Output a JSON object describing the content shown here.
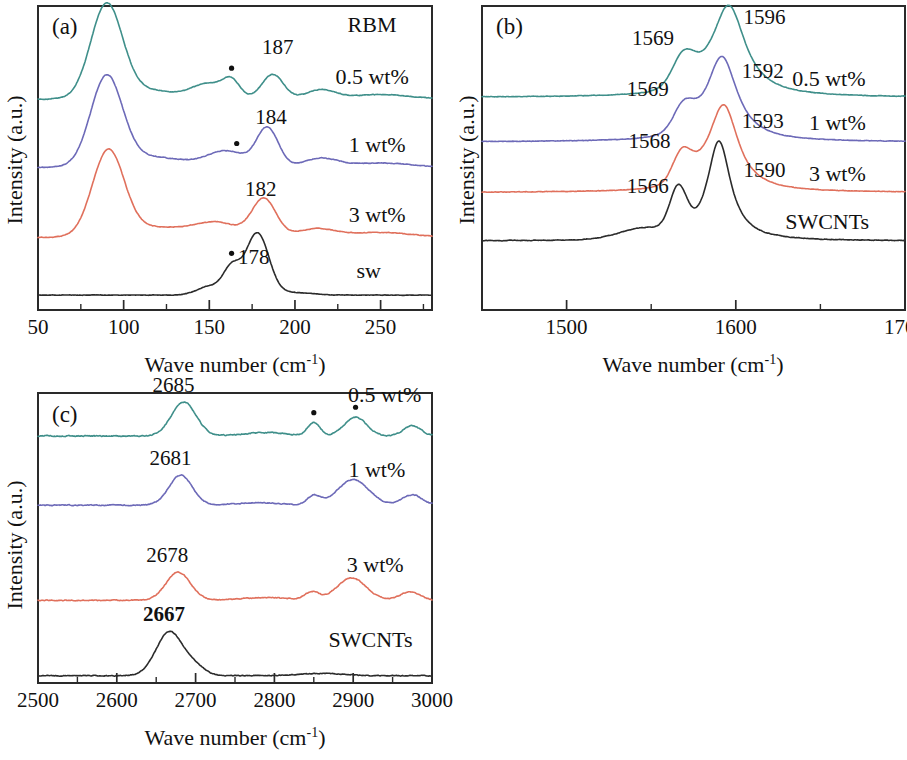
{
  "figure": {
    "background": "#ffffff",
    "width": 907,
    "height": 760
  },
  "colors": {
    "teal": "#3f8f8a",
    "purple": "#6d6ab8",
    "salmon": "#e0705c",
    "black": "#2b2b2b",
    "axis": "#2a2a2a"
  },
  "axis_titles": {
    "x": "Wave number (cm",
    "x_sup": "-1",
    "x_close": ")",
    "y": "Intensity (a.u.)"
  },
  "panels": [
    {
      "id": "a",
      "tag": "(a)",
      "corner_label": "RBM",
      "xlabel": "Wave number (cm-1)",
      "ylabel": "Intensity (a.u.)",
      "xlim": [
        50,
        280
      ],
      "major_ticks": [
        50,
        100,
        150,
        200,
        250
      ],
      "minor_ticks": [
        75,
        125,
        175,
        225,
        275
      ],
      "tick_labels": [
        "50",
        "100",
        "150",
        "200",
        "250"
      ],
      "series": [
        {
          "name": "0.5 wt%",
          "color": "#3f8f8a",
          "label": "0.5 wt%",
          "label_x": 245,
          "peak_label": "187",
          "peak_label_x": 190,
          "dots": [
            163
          ]
        },
        {
          "name": "1 wt%",
          "color": "#6d6ab8",
          "label": "1 wt%",
          "label_x": 248,
          "peak_label": "184",
          "peak_label_x": 186,
          "dots": [
            166
          ]
        },
        {
          "name": "3 wt%",
          "color": "#e0705c",
          "label": "3 wt%",
          "label_x": 248,
          "peak_label": "182",
          "peak_label_x": 180,
          "dots": []
        },
        {
          "name": "sw",
          "color": "#2b2b2b",
          "label": "sw",
          "label_x": 243,
          "peak_label": "178",
          "peak_label_x": 176,
          "dots": [
            163
          ]
        }
      ]
    },
    {
      "id": "b",
      "tag": "(b)",
      "corner_label": "",
      "xlabel": "Wave number (cm-1)",
      "ylabel": "Intensity (a.u.)",
      "xlim": [
        1450,
        1700
      ],
      "major_ticks": [
        1500,
        1600,
        1700
      ],
      "minor_ticks": [
        1450,
        1550,
        1650
      ],
      "tick_labels": [
        "1500",
        "1600",
        "1700"
      ],
      "series": [
        {
          "name": "0.5 wt%",
          "color": "#3f8f8a",
          "label": "0.5 wt%",
          "label_x": 1655,
          "peak_labels": [
            {
              "text": "1596",
              "x": 1617
            },
            {
              "text": "1569",
              "x": 1551
            }
          ],
          "dots": []
        },
        {
          "name": "1 wt%",
          "color": "#6d6ab8",
          "label": "1 wt%",
          "label_x": 1660,
          "peak_labels": [
            {
              "text": "1592",
              "x": 1616
            },
            {
              "text": "1569",
              "x": 1548
            }
          ],
          "dots": []
        },
        {
          "name": "3 wt%",
          "color": "#e0705c",
          "label": "3 wt%",
          "label_x": 1660,
          "peak_labels": [
            {
              "text": "1593",
              "x": 1616
            },
            {
              "text": "1568",
              "x": 1549
            }
          ],
          "dots": []
        },
        {
          "name": "SWCNTs",
          "color": "#2b2b2b",
          "label": "SWCNTs",
          "label_x": 1654,
          "peak_labels": [
            {
              "text": "1590",
              "x": 1617
            },
            {
              "text": "1566",
              "x": 1548
            }
          ],
          "dots": []
        }
      ]
    },
    {
      "id": "c",
      "tag": "(c)",
      "corner_label": "",
      "xlabel": "Wave number (cm-1)",
      "ylabel": "Intensity (a.u.)",
      "xlim": [
        2500,
        3000
      ],
      "major_ticks": [
        2500,
        2600,
        2700,
        2800,
        2900,
        3000
      ],
      "minor_ticks": [
        2550,
        2650,
        2750,
        2850,
        2950
      ],
      "tick_labels": [
        "2500",
        "2600",
        "2700",
        "2800",
        "2900",
        "3000"
      ],
      "series": [
        {
          "name": "0.5 wt%",
          "color": "#3f8f8a",
          "label": "0.5 wt%",
          "label_x": 2940,
          "peak_label": "2685",
          "peak_label_x": 2672,
          "bold": false,
          "dots": [
            2850,
            2903
          ]
        },
        {
          "name": "1 wt%",
          "color": "#6d6ab8",
          "label": "1 wt%",
          "label_x": 2930,
          "peak_label": "2681",
          "peak_label_x": 2668,
          "bold": false,
          "dots": []
        },
        {
          "name": "3 wt%",
          "color": "#e0705c",
          "label": "3 wt%",
          "label_x": 2928,
          "peak_label": "2678",
          "peak_label_x": 2664,
          "bold": false,
          "dots": []
        },
        {
          "name": "SWCNTs",
          "color": "#2b2b2b",
          "label": "SWCNTs",
          "label_x": 2922,
          "peak_label": "2667",
          "peak_label_x": 2660,
          "bold": true,
          "dots": []
        }
      ]
    }
  ],
  "chart_data": {
    "type": "line",
    "xlabel": "Wave number (cm-1)",
    "ylabel": "Intensity (a.u.)",
    "note": "Three-panel stacked-offset Raman spectra. Panel (a) RBM region, panel (b) G-band region, panel (c) G'/2D region. Dots mark impurity/reference bands.",
    "panels": [
      {
        "panel": "a",
        "region": "RBM",
        "xlim": [
          50,
          280
        ],
        "xticks": [
          50,
          100,
          150,
          200,
          250
        ],
        "series": [
          {
            "name": "0.5 wt%",
            "color": "#3f8f8a",
            "peaks_cm1": [
              90,
              187
            ],
            "marked_dot_cm1": [
              163
            ]
          },
          {
            "name": "1 wt%",
            "color": "#6d6ab8",
            "peaks_cm1": [
              90,
              184
            ],
            "marked_dot_cm1": [
              166
            ]
          },
          {
            "name": "3 wt%",
            "color": "#e0705c",
            "peaks_cm1": [
              91,
              182
            ],
            "marked_dot_cm1": []
          },
          {
            "name": "sw",
            "color": "#2b2b2b",
            "peaks_cm1": [
              178
            ],
            "marked_dot_cm1": [
              163
            ]
          }
        ]
      },
      {
        "panel": "b",
        "region": "G band",
        "xlim": [
          1450,
          1700
        ],
        "xticks": [
          1500,
          1600,
          1700
        ],
        "series": [
          {
            "name": "0.5 wt%",
            "color": "#3f8f8a",
            "peaks_cm1": [
              1569,
              1596
            ]
          },
          {
            "name": "1 wt%",
            "color": "#6d6ab8",
            "peaks_cm1": [
              1569,
              1592
            ]
          },
          {
            "name": "3 wt%",
            "color": "#e0705c",
            "peaks_cm1": [
              1568,
              1593
            ]
          },
          {
            "name": "SWCNTs",
            "color": "#2b2b2b",
            "peaks_cm1": [
              1566,
              1590
            ]
          }
        ]
      },
      {
        "panel": "c",
        "region": "G' / 2D band",
        "xlim": [
          2500,
          3000
        ],
        "xticks": [
          2500,
          2600,
          2700,
          2800,
          2900,
          3000
        ],
        "series": [
          {
            "name": "0.5 wt%",
            "color": "#3f8f8a",
            "peaks_cm1": [
              2685
            ],
            "marked_dot_cm1": [
              2850,
              2903
            ]
          },
          {
            "name": "1 wt%",
            "color": "#6d6ab8",
            "peaks_cm1": [
              2681
            ],
            "marked_dot_cm1": []
          },
          {
            "name": "3 wt%",
            "color": "#e0705c",
            "peaks_cm1": [
              2678
            ],
            "marked_dot_cm1": []
          },
          {
            "name": "SWCNTs",
            "color": "#2b2b2b",
            "peaks_cm1": [
              2667
            ],
            "marked_dot_cm1": []
          }
        ]
      }
    ]
  }
}
